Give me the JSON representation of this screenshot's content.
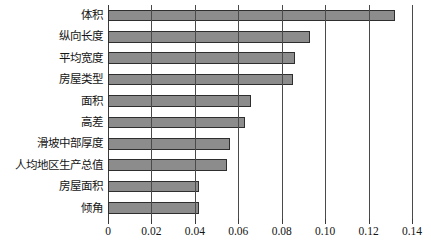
{
  "chart_data": {
    "type": "bar",
    "orientation": "horizontal",
    "title": "",
    "subtitle": "",
    "xlabel": "",
    "ylabel": "",
    "xlim": [
      0,
      0.14
    ],
    "ylim": null,
    "grid": "vertical",
    "legend": null,
    "categories": [
      "体积",
      "纵向长度",
      "平均宽度",
      "房屋类型",
      "面积",
      "高差",
      "滑坡中部厚度",
      "人均地区生产总值",
      "房屋面积",
      "倾角"
    ],
    "values": [
      0.132,
      0.093,
      0.086,
      0.085,
      0.066,
      0.063,
      0.056,
      0.055,
      0.042,
      0.042
    ],
    "xticks": [
      0,
      0.02,
      0.04,
      0.06,
      0.08,
      0.1,
      0.12,
      0.14
    ],
    "xtick_labels": [
      "0",
      "0.02",
      "0.04",
      "0.06",
      "0.08",
      "0.10",
      "0.12",
      "0.14"
    ],
    "colors": {
      "bar_fill": "#8c8c8c",
      "bar_edge": "#2e2e2e",
      "grid": "#4a4a4a",
      "axis": "#3a3a3a",
      "text": "#141414",
      "background": "#ffffff"
    }
  }
}
